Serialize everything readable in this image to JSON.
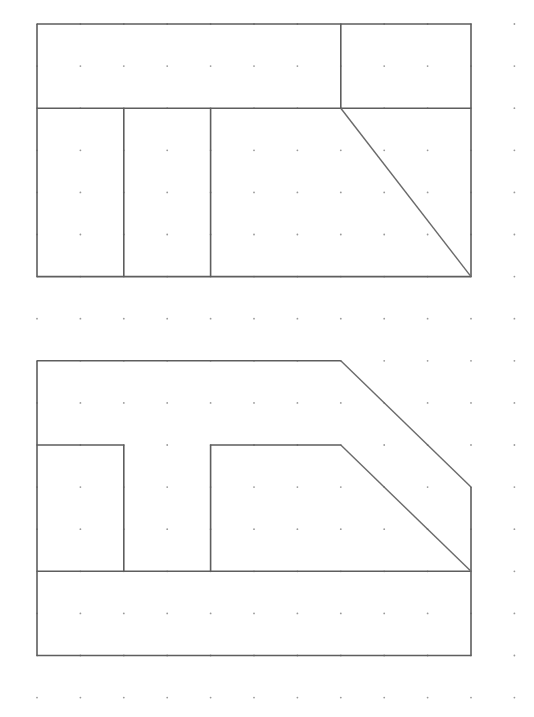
{
  "diagram": {
    "type": "isometric-dot-grid-orthographic-views",
    "grid": {
      "columns": 12,
      "rows": 17,
      "x_origin": 37,
      "y_origin": 24,
      "x_step": 43.4,
      "y_step": 42.1,
      "dot_color": "#9a9a9a"
    },
    "line_color": "#5e5e5e",
    "views": [
      {
        "name": "top-view",
        "description": "Rectangle 10x6 grid units split horizontally at row 2; upper band split at column 7; lower band split at columns 2 and 4; diagonal from (7,2) to (10,6)",
        "polylines": [
          [
            [
              0,
              0
            ],
            [
              10,
              0
            ],
            [
              10,
              6
            ],
            [
              0,
              6
            ],
            [
              0,
              0
            ]
          ],
          [
            [
              0,
              2
            ],
            [
              10,
              2
            ]
          ],
          [
            [
              7,
              0
            ],
            [
              7,
              2
            ]
          ],
          [
            [
              2,
              2
            ],
            [
              2,
              6
            ]
          ],
          [
            [
              4,
              2
            ],
            [
              4,
              6
            ]
          ]
        ],
        "diagonals": [
          [
            [
              7,
              2
            ],
            [
              10,
              6
            ]
          ]
        ]
      },
      {
        "name": "front-view",
        "description": "Outline with chamfered top-right corner; inner T-shaped notch with slanted edge; base band from row 13 to 15",
        "polylines": [
          [
            [
              0,
              8
            ],
            [
              7,
              8
            ]
          ],
          [
            [
              10,
              11
            ],
            [
              10,
              15
            ],
            [
              0,
              15
            ],
            [
              0,
              8
            ]
          ],
          [
            [
              0,
              10
            ],
            [
              2,
              10
            ],
            [
              2,
              13
            ]
          ],
          [
            [
              4,
              13
            ],
            [
              4,
              10
            ],
            [
              7,
              10
            ]
          ],
          [
            [
              0,
              13
            ],
            [
              10,
              13
            ]
          ]
        ],
        "diagonals": [
          [
            [
              7,
              8
            ],
            [
              10,
              11
            ]
          ],
          [
            [
              7,
              10
            ],
            [
              10,
              13
            ]
          ]
        ]
      }
    ]
  }
}
